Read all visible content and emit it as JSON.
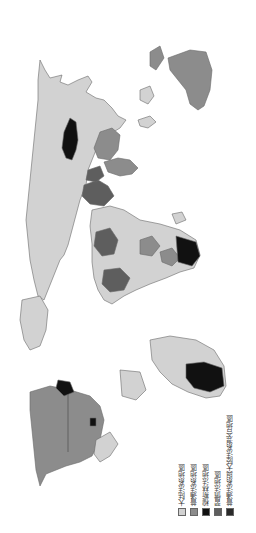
{
  "map": {
    "orientation": "rotated 90 degrees clockwise",
    "subject": "World legal systems",
    "colors": {
      "civil_law": "#d2d2d2",
      "common_law": "#8c8c8c",
      "muslim_law": "#111111",
      "customary_law": "#5e5e5e",
      "mixed_common_civil": "#2a2a2a",
      "border": "#6a6a6a",
      "background": "#ffffff"
    }
  },
  "legend": {
    "items": [
      {
        "label": "大陆法系地區",
        "color": "#d2d2d2"
      },
      {
        "label": "普通法系地區",
        "color": "#8c8c8c"
      },
      {
        "label": "穆斯林法地區",
        "color": "#111111"
      },
      {
        "label": "習慣法地區",
        "color": "#5e5e5e"
      },
      {
        "label": "普通法系與大陸法系混合地區",
        "color": "#2a2a2a"
      }
    ]
  }
}
